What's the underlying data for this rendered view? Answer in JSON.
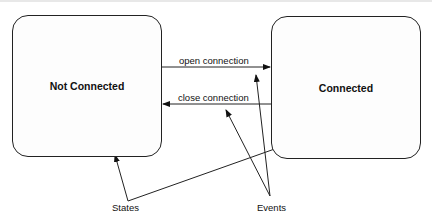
{
  "diagram": {
    "type": "state-diagram",
    "states": [
      {
        "id": "not_connected",
        "label": "Not Connected"
      },
      {
        "id": "connected",
        "label": "Connected"
      }
    ],
    "transitions": [
      {
        "label": "open connection",
        "from": "not_connected",
        "to": "connected"
      },
      {
        "label": "close connection",
        "from": "connected",
        "to": "not_connected"
      }
    ],
    "annotations": [
      {
        "label": "States",
        "points_to": [
          "not_connected",
          "connected"
        ]
      },
      {
        "label": "Events",
        "points_to": [
          "open connection",
          "close connection"
        ]
      }
    ]
  },
  "colors": {
    "line": "#222222",
    "background": "#ffffff"
  }
}
